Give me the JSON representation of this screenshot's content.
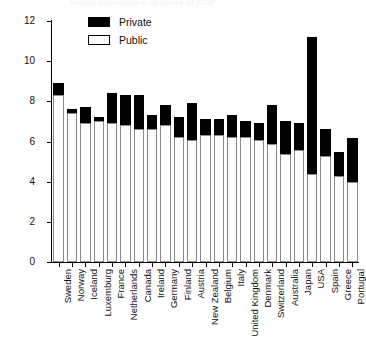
{
  "faint_header": "Health expenditure as share of GDP",
  "legend": {
    "position": "top-left-inside",
    "entries": [
      {
        "label": "Private",
        "color": "#000000",
        "swatch": "filled-black-square"
      },
      {
        "label": "Public",
        "color": "#ffffff",
        "swatch": "outlined-white-square"
      }
    ]
  },
  "chart_data": {
    "type": "bar",
    "subtype": "stacked-vertical",
    "title": "",
    "subtitle": "",
    "xlabel": "",
    "ylabel": "",
    "ylim": [
      0,
      12
    ],
    "yticks": [
      0,
      2,
      4,
      6,
      8,
      10,
      12
    ],
    "grid": false,
    "legend_position": "upper left inside plot",
    "categories": [
      "Sweden",
      "Norway",
      "Iceland",
      "Luxemburg",
      "France",
      "Netherlands",
      "Canada",
      "Ireland",
      "Germany",
      "Finland",
      "Austria",
      "New Zealand",
      "Belgium",
      "Italy",
      "United Kingdom",
      "Denmark",
      "Switzerland",
      "Australia",
      "Japan",
      "USA",
      "Spain",
      "Greece",
      "Portugal"
    ],
    "series": [
      {
        "name": "Public",
        "color": "#ffffff",
        "values": [
          8.3,
          7.4,
          6.9,
          7.0,
          6.9,
          6.8,
          6.6,
          6.6,
          6.8,
          6.2,
          6.1,
          6.3,
          6.3,
          6.2,
          6.2,
          6.1,
          5.9,
          5.4,
          5.6,
          4.4,
          5.3,
          4.3,
          4.0
        ]
      },
      {
        "name": "Private",
        "color": "#000000",
        "values": [
          0.6,
          0.2,
          0.8,
          0.2,
          1.5,
          1.5,
          1.7,
          0.7,
          1.0,
          1.0,
          1.8,
          0.8,
          0.8,
          1.1,
          0.8,
          0.8,
          1.9,
          1.6,
          1.3,
          6.8,
          1.3,
          1.2,
          2.2
        ]
      }
    ],
    "totals": [
      8.9,
      7.6,
      7.7,
      7.2,
      8.4,
      8.3,
      8.3,
      7.3,
      7.8,
      7.2,
      7.9,
      7.1,
      7.1,
      7.3,
      7.0,
      6.9,
      7.8,
      7.0,
      6.9,
      11.2,
      6.6,
      5.5,
      6.2
    ]
  }
}
